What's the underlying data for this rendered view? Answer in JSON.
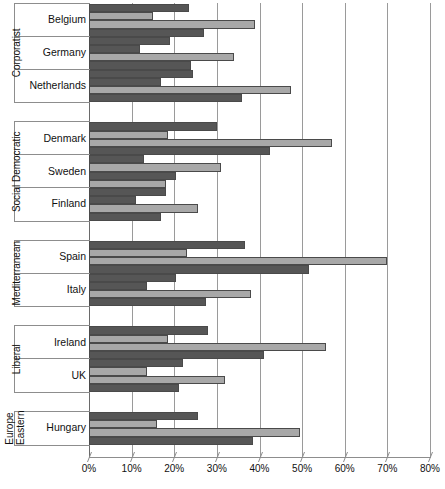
{
  "chart_data": {
    "type": "bar",
    "orientation": "horizontal",
    "title": "",
    "xlabel": "",
    "ylabel": "",
    "xlim": [
      0,
      80
    ],
    "xtick_labels": [
      "0%",
      "10%",
      "20%",
      "30%",
      "40%",
      "50%",
      "60%",
      "70%",
      "80%"
    ],
    "xticks": [
      0,
      10,
      20,
      30,
      40,
      50,
      60,
      70,
      80
    ],
    "grid": true,
    "legend": "none",
    "series_count": 4,
    "colors": {
      "dark": "#565656",
      "light": "#a8a8a8",
      "gridline": "#9a9a9a",
      "text": "#111111"
    },
    "groups": [
      {
        "label": "Corporatist",
        "countries": [
          {
            "name": "Belgium",
            "values": [
              23.5,
              15.0,
              39.0,
              27.0
            ],
            "styles": [
              "dark",
              "light",
              "light",
              "dark"
            ]
          },
          {
            "name": "Germany",
            "values": [
              19.0,
              12.0,
              34.0,
              24.0
            ],
            "styles": [
              "dark",
              "dark",
              "light",
              "dark"
            ]
          },
          {
            "name": "Netherlands",
            "values": [
              24.5,
              17.0,
              47.5,
              36.0
            ],
            "styles": [
              "dark",
              "dark",
              "light",
              "dark"
            ]
          }
        ]
      },
      {
        "label": "Social Democratic",
        "countries": [
          {
            "name": "Denmark",
            "values": [
              30.0,
              18.5,
              57.0,
              42.5
            ],
            "styles": [
              "dark",
              "light",
              "light",
              "dark"
            ]
          },
          {
            "name": "Sweden",
            "values": [
              13.0,
              31.0,
              20.5,
              18.0
            ],
            "styles": [
              "dark",
              "light",
              "dark",
              "light"
            ]
          },
          {
            "name": "Finland",
            "values": [
              18.0,
              11.0,
              25.5,
              17.0
            ],
            "styles": [
              "dark",
              "dark",
              "light",
              "dark"
            ]
          }
        ]
      },
      {
        "label": "Mediterranean",
        "countries": [
          {
            "name": "Spain",
            "values": [
              36.5,
              23.0,
              70.0,
              51.5
            ],
            "styles": [
              "dark",
              "light",
              "light",
              "dark"
            ]
          },
          {
            "name": "Italy",
            "values": [
              20.5,
              13.5,
              38.0,
              27.5
            ],
            "styles": [
              "dark",
              "dark",
              "light",
              "dark"
            ]
          }
        ]
      },
      {
        "label": "Liberal",
        "countries": [
          {
            "name": "Ireland",
            "values": [
              28.0,
              18.5,
              55.5,
              41.0
            ],
            "styles": [
              "dark",
              "light",
              "light",
              "dark"
            ]
          },
          {
            "name": "UK",
            "values": [
              22.0,
              13.5,
              32.0,
              21.0
            ],
            "styles": [
              "dark",
              "light",
              "light",
              "dark"
            ]
          }
        ]
      },
      {
        "label": "Europe\nEastern",
        "countries": [
          {
            "name": "Hungary",
            "values": [
              25.5,
              16.0,
              49.5,
              38.5
            ],
            "styles": [
              "dark",
              "light",
              "light",
              "dark"
            ]
          }
        ]
      }
    ]
  }
}
